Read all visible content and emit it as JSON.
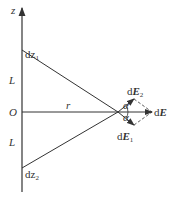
{
  "diagram": {
    "axis_label": "z",
    "origin_label": "O",
    "upper_segment_label": "L",
    "lower_segment_label": "L",
    "distance_label": "r",
    "element_top": {
      "prefix": "dz",
      "sub": "1"
    },
    "element_bottom": {
      "prefix": "dz",
      "sub": "2"
    },
    "field_E2": {
      "d": "d",
      "E": "E",
      "sub": "2"
    },
    "field_E1": {
      "d": "d",
      "E": "E",
      "sub": "1"
    },
    "field_total": {
      "d": "d",
      "E": "E"
    },
    "angle_upper": "α",
    "angle_lower": "α",
    "colors": {
      "line": "#333333",
      "background": "#ffffff"
    }
  }
}
